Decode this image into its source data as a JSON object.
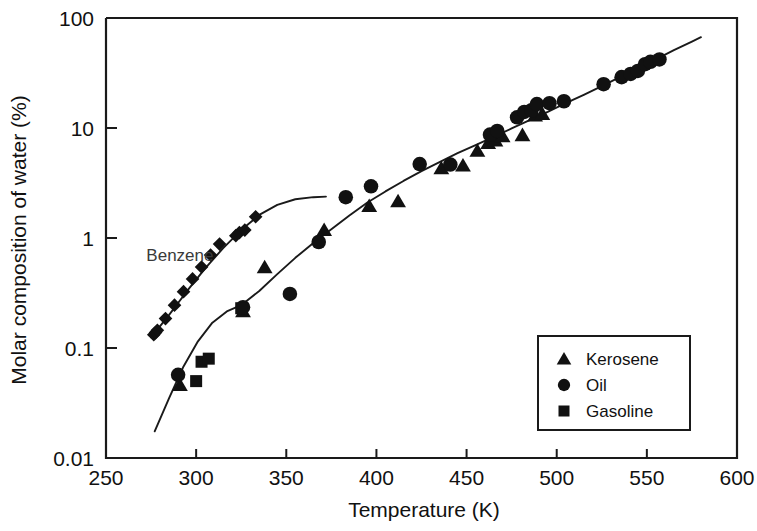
{
  "chart_data": {
    "type": "scatter",
    "title": "",
    "xlabel": "Temperature (K)",
    "ylabel": "Molar composition of water (%)",
    "xlim": [
      250,
      600
    ],
    "ylim": [
      0.01,
      100
    ],
    "yscale": "log",
    "xscale": "linear",
    "grid": false,
    "xticks": [
      250,
      300,
      350,
      400,
      450,
      500,
      550,
      600
    ],
    "xtick_labels": [
      "250",
      "300",
      "350",
      "400",
      "450",
      "500",
      "550",
      "600"
    ],
    "yticks": [
      0.01,
      0.1,
      1,
      10,
      100
    ],
    "ytick_labels": [
      "0.01",
      "0.1",
      "1",
      "10",
      "100"
    ],
    "legend_position": "lower-right",
    "legend_entries": [
      {
        "label": "Kerosene",
        "marker": "triangle"
      },
      {
        "label": "Oil",
        "marker": "circle"
      },
      {
        "label": "Gasoline",
        "marker": "square"
      }
    ],
    "annotations": [
      {
        "text": "Benzene",
        "x": 291,
        "y": 0.62
      }
    ],
    "series": [
      {
        "name": "Benzene",
        "marker": "diamond",
        "points": [
          [
            276.5,
            0.132
          ],
          [
            277.5,
            0.138
          ],
          [
            278.5,
            0.145
          ],
          [
            283.0,
            0.185
          ],
          [
            288.0,
            0.245
          ],
          [
            293.0,
            0.325
          ],
          [
            298.0,
            0.425
          ],
          [
            303.0,
            0.545
          ],
          [
            308.0,
            0.7
          ],
          [
            313.0,
            0.88
          ],
          [
            322.0,
            1.05
          ],
          [
            324.0,
            1.12
          ],
          [
            327.0,
            1.18
          ],
          [
            333.0,
            1.56
          ]
        ]
      },
      {
        "name": "Kerosene",
        "marker": "triangle",
        "points": [
          [
            291.0,
            0.046
          ],
          [
            326.0,
            0.215
          ],
          [
            338.0,
            0.54
          ],
          [
            371.0,
            1.18
          ],
          [
            396.0,
            1.95
          ],
          [
            412.0,
            2.15
          ],
          [
            436.0,
            4.3
          ],
          [
            448.0,
            4.55
          ],
          [
            456.0,
            6.2
          ],
          [
            462.0,
            7.3
          ],
          [
            466.0,
            7.7
          ],
          [
            470.0,
            8.4
          ],
          [
            481.0,
            8.6
          ],
          [
            488.0,
            13.0
          ],
          [
            492.0,
            13.4
          ]
        ]
      },
      {
        "name": "Oil",
        "marker": "circle",
        "points": [
          [
            290.0,
            0.057
          ],
          [
            326.0,
            0.235
          ],
          [
            352.0,
            0.31
          ],
          [
            368.0,
            0.92
          ],
          [
            383.0,
            2.35
          ],
          [
            397.0,
            2.95
          ],
          [
            424.0,
            4.7
          ],
          [
            441.0,
            4.65
          ],
          [
            463.0,
            8.7
          ],
          [
            467.0,
            9.4
          ],
          [
            478.0,
            12.5
          ],
          [
            482.0,
            14.0
          ],
          [
            486.0,
            14.5
          ],
          [
            489.0,
            16.5
          ],
          [
            496.0,
            16.8
          ],
          [
            504.0,
            17.5
          ],
          [
            526.0,
            25.0
          ],
          [
            536.0,
            29.0
          ],
          [
            541.0,
            31.0
          ],
          [
            545.0,
            33.0
          ],
          [
            549.0,
            38.0
          ],
          [
            552.0,
            40.0
          ],
          [
            557.0,
            42.0
          ]
        ]
      },
      {
        "name": "Gasoline",
        "marker": "square",
        "points": [
          [
            300.0,
            0.05
          ],
          [
            303.0,
            0.075
          ],
          [
            307.0,
            0.08
          ],
          [
            325.0,
            0.23
          ]
        ]
      }
    ],
    "fit_curves": [
      {
        "name": "Benzene fit",
        "points": [
          [
            275.0,
            0.125
          ],
          [
            285.0,
            0.2
          ],
          [
            295.0,
            0.33
          ],
          [
            305.0,
            0.53
          ],
          [
            315.0,
            0.81
          ],
          [
            325.0,
            1.18
          ],
          [
            335.0,
            1.62
          ],
          [
            345.0,
            2.0
          ],
          [
            355.0,
            2.25
          ],
          [
            365.0,
            2.35
          ],
          [
            372.0,
            2.38
          ]
        ]
      },
      {
        "name": "Hydrocarbon fit",
        "points": [
          [
            277.0,
            0.0175
          ],
          [
            285.0,
            0.035
          ],
          [
            293.0,
            0.068
          ],
          [
            301.0,
            0.115
          ],
          [
            309.0,
            0.17
          ],
          [
            317.0,
            0.215
          ],
          [
            325.0,
            0.245
          ],
          [
            335.0,
            0.33
          ],
          [
            345.0,
            0.47
          ],
          [
            355.0,
            0.66
          ],
          [
            365.0,
            0.9
          ],
          [
            375.0,
            1.2
          ],
          [
            385.0,
            1.6
          ],
          [
            395.0,
            2.1
          ],
          [
            405.0,
            2.65
          ],
          [
            415.0,
            3.3
          ],
          [
            425.0,
            4.05
          ],
          [
            435.0,
            4.9
          ],
          [
            445.0,
            5.9
          ],
          [
            455.0,
            7.0
          ],
          [
            465.0,
            8.3
          ],
          [
            475.0,
            9.9
          ],
          [
            485.0,
            11.8
          ],
          [
            495.0,
            14.0
          ],
          [
            505.0,
            16.8
          ],
          [
            515.0,
            20.0
          ],
          [
            525.0,
            24.0
          ],
          [
            535.0,
            29.0
          ],
          [
            545.0,
            35.0
          ],
          [
            555.0,
            42.0
          ],
          [
            565.0,
            51.0
          ],
          [
            575.0,
            61.0
          ],
          [
            580.0,
            67.0
          ]
        ]
      }
    ]
  },
  "colors": {
    "ink": "#111111",
    "background": "#ffffff",
    "annotation": "#3a3a3a"
  }
}
